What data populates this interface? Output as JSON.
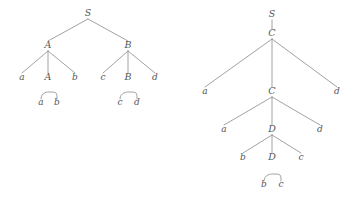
{
  "figure": {
    "title": "",
    "background_color": "#ffffff",
    "line_color": "#8a8a8a",
    "text_color": "#555555"
  },
  "diagram_type": "parse-tree-pair",
  "trees": [
    {
      "id": "left-tree",
      "name": "left-parse-tree",
      "root": "S",
      "nodes": [
        {
          "id": "L0",
          "label": "S",
          "kind": "nonterminal",
          "x": 88,
          "y": 16,
          "level": 0
        },
        {
          "id": "L1",
          "label": "A",
          "kind": "nonterminal",
          "x": 48,
          "y": 48,
          "level": 1
        },
        {
          "id": "L2",
          "label": "B",
          "kind": "nonterminal",
          "x": 128,
          "y": 48,
          "level": 1
        },
        {
          "id": "L3",
          "label": "a",
          "kind": "terminal",
          "x": 22,
          "y": 80,
          "level": 2
        },
        {
          "id": "L4",
          "label": "A",
          "kind": "nonterminal",
          "x": 48,
          "y": 80,
          "level": 2
        },
        {
          "id": "L5",
          "label": "b",
          "kind": "terminal",
          "x": 75,
          "y": 80,
          "level": 2
        },
        {
          "id": "L6",
          "label": "c",
          "kind": "terminal",
          "x": 103,
          "y": 80,
          "level": 2
        },
        {
          "id": "L7",
          "label": "B",
          "kind": "nonterminal",
          "x": 128,
          "y": 80,
          "level": 2
        },
        {
          "id": "L8",
          "label": "d",
          "kind": "terminal",
          "x": 155,
          "y": 80,
          "level": 2
        },
        {
          "id": "L9",
          "label": "a",
          "kind": "terminal",
          "x": 41,
          "y": 105,
          "level": 3
        },
        {
          "id": "L10",
          "label": "b",
          "kind": "terminal",
          "x": 57,
          "y": 105,
          "level": 3
        },
        {
          "id": "L11",
          "label": "c",
          "kind": "terminal",
          "x": 120,
          "y": 105,
          "level": 3
        },
        {
          "id": "L12",
          "label": "d",
          "kind": "terminal",
          "x": 137,
          "y": 105,
          "level": 3
        }
      ],
      "edges": [
        {
          "from": "L0",
          "to": "L1"
        },
        {
          "from": "L0",
          "to": "L2"
        },
        {
          "from": "L1",
          "to": "L3"
        },
        {
          "from": "L1",
          "to": "L4"
        },
        {
          "from": "L1",
          "to": "L5"
        },
        {
          "from": "L2",
          "to": "L6"
        },
        {
          "from": "L2",
          "to": "L7"
        },
        {
          "from": "L2",
          "to": "L8"
        }
      ],
      "arcs": [
        {
          "from": "L4",
          "left": "L9",
          "right": "L10"
        },
        {
          "from": "L7",
          "left": "L11",
          "right": "L12"
        }
      ]
    },
    {
      "id": "right-tree",
      "name": "right-parse-tree",
      "root": "S",
      "nodes": [
        {
          "id": "R0",
          "label": "S",
          "kind": "nonterminal",
          "x": 272,
          "y": 17,
          "level": 0
        },
        {
          "id": "R1",
          "label": "C",
          "kind": "nonterminal",
          "x": 272,
          "y": 36,
          "level": 1
        },
        {
          "id": "R2",
          "label": "a",
          "kind": "terminal",
          "x": 205,
          "y": 94,
          "level": 2
        },
        {
          "id": "R3",
          "label": "C",
          "kind": "nonterminal",
          "x": 272,
          "y": 94,
          "level": 2
        },
        {
          "id": "R4",
          "label": "d",
          "kind": "terminal",
          "x": 337,
          "y": 94,
          "level": 2
        },
        {
          "id": "R5",
          "label": "a",
          "kind": "terminal",
          "x": 224,
          "y": 132,
          "level": 3
        },
        {
          "id": "R6",
          "label": "D",
          "kind": "nonterminal",
          "x": 272,
          "y": 132,
          "level": 3
        },
        {
          "id": "R7",
          "label": "d",
          "kind": "terminal",
          "x": 320,
          "y": 132,
          "level": 3
        },
        {
          "id": "R8",
          "label": "b",
          "kind": "terminal",
          "x": 243,
          "y": 160,
          "level": 4
        },
        {
          "id": "R9",
          "label": "D",
          "kind": "nonterminal",
          "x": 272,
          "y": 160,
          "level": 4
        },
        {
          "id": "R10",
          "label": "c",
          "kind": "terminal",
          "x": 301,
          "y": 160,
          "level": 4
        },
        {
          "id": "R11",
          "label": "b",
          "kind": "terminal",
          "x": 264,
          "y": 187,
          "level": 5
        },
        {
          "id": "R12",
          "label": "c",
          "kind": "terminal",
          "x": 281,
          "y": 187,
          "level": 5
        }
      ],
      "edges": [
        {
          "from": "R0",
          "to": "R1"
        },
        {
          "from": "R1",
          "to": "R2"
        },
        {
          "from": "R1",
          "to": "R3"
        },
        {
          "from": "R1",
          "to": "R4"
        },
        {
          "from": "R3",
          "to": "R5"
        },
        {
          "from": "R3",
          "to": "R6"
        },
        {
          "from": "R3",
          "to": "R7"
        },
        {
          "from": "R6",
          "to": "R8"
        },
        {
          "from": "R6",
          "to": "R9"
        },
        {
          "from": "R6",
          "to": "R10"
        }
      ],
      "arcs": [
        {
          "from": "R9",
          "left": "R11",
          "right": "R12"
        }
      ]
    }
  ]
}
